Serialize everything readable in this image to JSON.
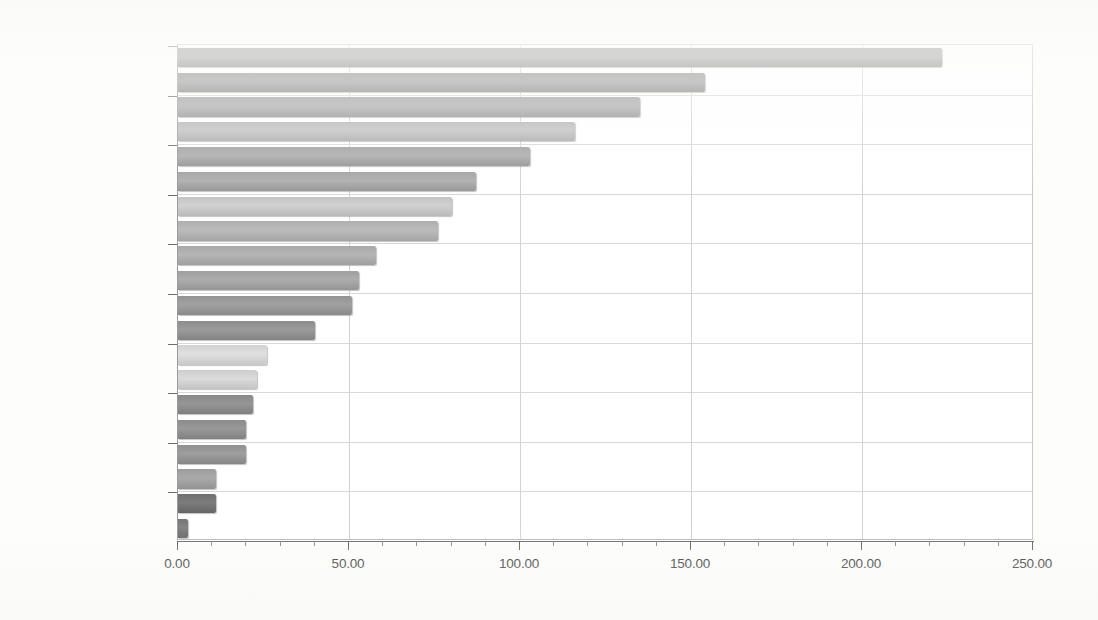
{
  "chart_data": {
    "type": "bar",
    "orientation": "horizontal",
    "title": "",
    "subtitle": "",
    "xlabel": "",
    "ylabel": "",
    "xlim": [
      0,
      250
    ],
    "ylim": null,
    "grid": true,
    "legend": null,
    "x_tick_labels": [
      "0.00",
      "50.00",
      "100.00",
      "150.00",
      "200.00",
      "250.00"
    ],
    "x_tick_values": [
      0,
      50,
      100,
      150,
      200,
      250
    ],
    "x_minor_step": 10,
    "categories": [
      "2012.11.11 21",
      "",
      "2012.11.08 19",
      "",
      "2012.11.05 17",
      "",
      "2012.11.06 10",
      "",
      "2012.11.05 13",
      "",
      "2012.11.07 19",
      "",
      "2012.11.11 19",
      "",
      "2012.11.05 10",
      "",
      "2012.11.09 11",
      "",
      "2012.11.11 22",
      ""
    ],
    "y_tick_labels": [
      "2012.11.11 21",
      "2012.11.08 19",
      "2012.11.05 17",
      "2012.11.06 10",
      "2012.11.05 13",
      "2012.11.07 19",
      "2012.11.11 19",
      "2012.11.05 10",
      "2012.11.09 11",
      "2012.11.11 22"
    ],
    "values": [
      223.5,
      154.0,
      135.0,
      116.0,
      103.0,
      87.0,
      80.0,
      76.0,
      58.0,
      53.0,
      51.0,
      40.0,
      26.0,
      23.0,
      22.0,
      20.0,
      20.0,
      11.0,
      11.0,
      3.0
    ],
    "bar_colors": [
      "#8e8e8e",
      "#8a8a8a",
      "#9a9a9a",
      "#b2b2b2",
      "#9e9e9e",
      "#a3a3a3",
      "#c3c3c3",
      "#aeaeae",
      "#a8a8a8",
      "#9f9f9f",
      "#939393",
      "#8d8d8d",
      "#d2d2d2",
      "#cdcdcd",
      "#888888",
      "#8b8b8b",
      "#909090",
      "#9c9c9c",
      "#6f6f6f",
      "#767676"
    ],
    "bar_count": 20
  },
  "colors": {
    "plot_background": "#ffffff",
    "page_background": "#fdfdfc",
    "gridline": "#d3d3d3",
    "axis_line": "#6a6a6a",
    "tick_label": "#232323"
  }
}
